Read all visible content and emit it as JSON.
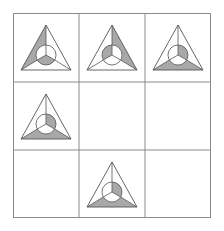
{
  "puzzle": {
    "rows": 3,
    "cols": 3,
    "colors": {
      "shade": "#a8a8a8",
      "line": "#555555",
      "grid": "#8a8a8a",
      "background": "#ffffff"
    },
    "figure": {
      "description": "Triangle with inscribed circle; three lines connect circle to triangle vertices dividing the outer area into left, right and bottom regions; three spokes divide the circle into upper-left, upper-right and bottom sectors."
    },
    "cells": [
      {
        "row": 0,
        "col": 0,
        "empty": false,
        "outer_shaded": "left",
        "circle_shaded": "bottom"
      },
      {
        "row": 0,
        "col": 1,
        "empty": false,
        "outer_shaded": "right",
        "circle_shaded": "upper-left"
      },
      {
        "row": 0,
        "col": 2,
        "empty": false,
        "outer_shaded": "bottom",
        "circle_shaded": "upper-right"
      },
      {
        "row": 1,
        "col": 0,
        "empty": false,
        "outer_shaded": "bottom",
        "circle_shaded": "upper-right"
      },
      {
        "row": 1,
        "col": 1,
        "empty": true
      },
      {
        "row": 1,
        "col": 2,
        "empty": true
      },
      {
        "row": 2,
        "col": 0,
        "empty": true
      },
      {
        "row": 2,
        "col": 1,
        "empty": false,
        "outer_shaded": "bottom",
        "circle_shaded": "upper-right"
      },
      {
        "row": 2,
        "col": 2,
        "empty": true
      }
    ]
  }
}
